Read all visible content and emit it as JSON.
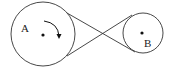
{
  "diagram": {
    "type": "crossed-belt-pulley",
    "pulleys": [
      {
        "id": "A",
        "label": "A",
        "cx": 43,
        "cy": 34,
        "r": 32,
        "rotation": "clockwise"
      },
      {
        "id": "B",
        "label": "B",
        "cx": 143,
        "cy": 33,
        "r": 20
      }
    ],
    "belt": {
      "style": "crossed"
    },
    "colors": {
      "stroke": "#333333",
      "background": "#ffffff"
    }
  }
}
